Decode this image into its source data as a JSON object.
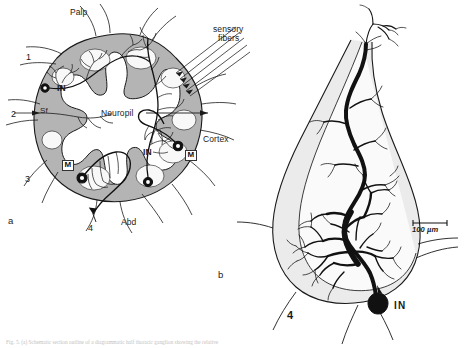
{
  "figure": {
    "type": "scientific-anatomical-diagram",
    "background_color": "#ffffff",
    "ink_color": "#1a1a1a",
    "cortex_fill": "#b8b8b8",
    "neuropil_fill": "#ffffff",
    "ganglion_fill": "#ececec",
    "panels": [
      {
        "id": "a",
        "label": "a"
      },
      {
        "id": "b",
        "label": "b"
      }
    ]
  },
  "panel_a": {
    "label": "a",
    "title_labels": {
      "palp": "Palp",
      "neuropil": "Neuropil",
      "cortex": "Cortex",
      "abdomen": "Abd",
      "sensory_fibers": "sensory\nfibers",
      "sensory_fibers_line1": "sensory",
      "sensory_fibers_line2": "fibers",
      "sensory_fiber_short": "Sf"
    },
    "nerve_roots": [
      {
        "id": "1",
        "label": "1"
      },
      {
        "id": "2",
        "label": "2"
      },
      {
        "id": "3",
        "label": "3"
      },
      {
        "id": "4",
        "label": "4"
      }
    ],
    "cell_labels": [
      {
        "id": "in-left",
        "label": "IN"
      },
      {
        "id": "in-right",
        "label": "IN"
      },
      {
        "id": "m-left",
        "label": "M"
      },
      {
        "id": "m-right",
        "label": "M"
      }
    ]
  },
  "panel_b": {
    "label": "b",
    "neuron_label": "IN",
    "root_label": "4",
    "scale_bar": {
      "value": "100",
      "unit": "µm",
      "text": "100 µm",
      "length_px": 34
    }
  },
  "caption": {
    "text": "Fig. 5. (a) Schematic section outline of a diagrammatic half thoracic ganglion showing the relative"
  }
}
